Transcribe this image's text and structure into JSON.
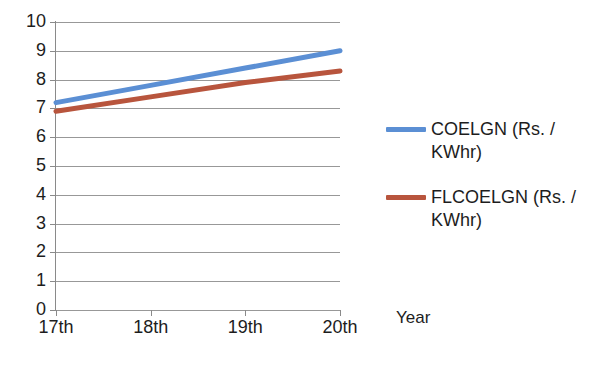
{
  "chart_data": {
    "type": "line",
    "title": "",
    "xlabel": "Year",
    "ylabel": "",
    "categories": [
      "17th",
      "18th",
      "19th",
      "20th"
    ],
    "x": [
      0,
      1,
      2,
      3
    ],
    "ylim": [
      0,
      10
    ],
    "ytick_step": 1,
    "yticks": [
      "0",
      "1",
      "2",
      "3",
      "4",
      "5",
      "6",
      "7",
      "8",
      "9",
      "10"
    ],
    "grid": "horizontal",
    "legend_position": "right",
    "series": [
      {
        "name": "COELGN (Rs. / KWhr)",
        "color": "#5B8FD4",
        "values": [
          7.2,
          7.8,
          8.4,
          9.0
        ]
      },
      {
        "name": "FLCOELGN (Rs. / KWhr)",
        "color": "#B8553D",
        "values": [
          6.9,
          7.4,
          7.9,
          8.3
        ]
      }
    ]
  },
  "axis": {
    "x_title": "Year"
  },
  "legend": {
    "entries": [
      {
        "label": "COELGN (Rs. / KWhr)",
        "color": "#5B8FD4"
      },
      {
        "label": "FLCOELGN (Rs. / KWhr)",
        "color": "#B8553D"
      }
    ]
  }
}
